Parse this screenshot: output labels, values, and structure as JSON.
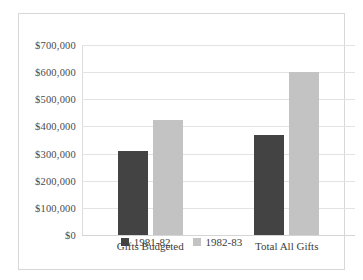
{
  "chart_data": {
    "type": "bar",
    "title": "",
    "xlabel": "",
    "ylabel": "",
    "categories": [
      "Gifts Budgeted",
      "Total All Gifts"
    ],
    "series": [
      {
        "name": "1981-82",
        "color": "#434343",
        "values": [
          310000,
          368000
        ]
      },
      {
        "name": "1982-83",
        "color": "#c3c3c3",
        "values": [
          425000,
          600000
        ]
      }
    ],
    "ylim": [
      0,
      700000
    ],
    "ytick_values": [
      700000,
      600000,
      500000,
      400000,
      300000,
      200000,
      100000,
      0
    ],
    "ytick_labels": [
      "$700,000",
      "$600,000",
      "$500,000",
      "$400,000",
      "$300,000",
      "$200,000",
      "$100,000",
      "$0"
    ],
    "grid": true,
    "legend_position": "bottom"
  }
}
